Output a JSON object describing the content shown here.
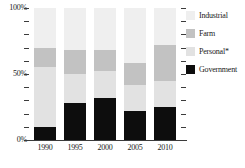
{
  "chart_data": {
    "type": "bar",
    "subtype": "stacked-percentage-column",
    "title": "",
    "xlabel": "",
    "ylabel": "",
    "categories": [
      "1990",
      "1995",
      "2000",
      "2005",
      "2010"
    ],
    "ylim": [
      0,
      100
    ],
    "ytick_labels": [
      "0%",
      "50%",
      "100%"
    ],
    "ytick_values": [
      0,
      50,
      100
    ],
    "minor_tick_interval": 10,
    "grid": false,
    "legend_position": "right",
    "stack_order_bottom_to_top": [
      "Government",
      "Personal*",
      "Farm",
      "Industrial"
    ],
    "series": [
      {
        "name": "Government",
        "color": "#0d0d0d",
        "values": [
          10,
          28,
          32,
          22,
          25
        ]
      },
      {
        "name": "Personal*",
        "color": "#e2e2e2",
        "values": [
          45,
          22,
          20,
          20,
          20
        ]
      },
      {
        "name": "Farm",
        "color": "#c2c2c2",
        "values": [
          15,
          18,
          16,
          16,
          27
        ]
      },
      {
        "name": "Industrial",
        "color": "#efefef",
        "values": [
          30,
          32,
          32,
          42,
          28
        ]
      }
    ],
    "annotations": [
      "*"
    ]
  },
  "legend": {
    "items": [
      {
        "label": "Industrial",
        "color": "#efefef"
      },
      {
        "label": "Farm",
        "color": "#c2c2c2"
      },
      {
        "label": "Personal*",
        "color": "#e2e2e2"
      },
      {
        "label": "Government",
        "color": "#0d0d0d"
      }
    ]
  },
  "yaxis": {
    "top_label": "100%",
    "mid_label": "50%",
    "bottom_label": "0%"
  },
  "xaxis": {
    "labels": [
      "1990",
      "1995",
      "2000",
      "2005",
      "2010"
    ]
  }
}
